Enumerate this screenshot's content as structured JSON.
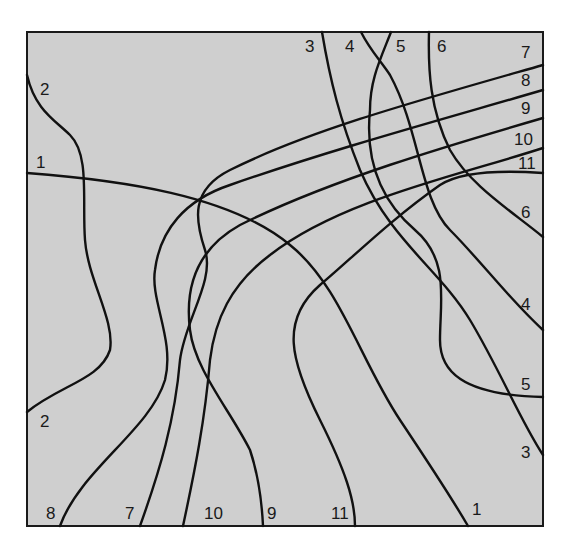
{
  "diagram": {
    "colors": {
      "background": "#ffffff",
      "square_fill": "#cfcfcf",
      "stroke": "#111111",
      "label": "#1a1a1a"
    },
    "frame": {
      "x": 27,
      "y": 32,
      "width": 516,
      "height": 494
    },
    "curves": [
      {
        "id": "1",
        "d": "M27,173 C120,180 230,195 290,245 C340,285 360,360 400,420 C430,465 450,495 468,526"
      },
      {
        "id": "2",
        "d": "M27,75 C35,110 55,120 70,135 C90,155 82,200 85,240 C88,280 115,320 110,350 C100,380 60,385 27,412"
      },
      {
        "id": "3",
        "d": "M322,32 C330,80 340,120 360,170 C390,240 440,270 470,320 C500,370 520,420 543,455"
      },
      {
        "id": "4",
        "d": "M361,32 C370,50 380,60 390,75 C420,130 420,200 450,230 C480,260 510,300 543,330"
      },
      {
        "id": "5",
        "d": "M391,32 C380,60 370,80 370,110 C365,160 380,200 415,230 C450,260 440,300 440,340 C440,370 460,395 543,397"
      },
      {
        "id": "6",
        "d": "M429,32 C428,70 430,110 450,150 C470,185 510,210 543,237"
      },
      {
        "id": "7",
        "d": "M543,65 C420,100 310,130 230,170 C190,190 195,220 205,250 C215,280 185,320 180,360 C175,420 160,470 140,526"
      },
      {
        "id": "8",
        "d": "M543,90 C440,120 330,150 230,185 C185,200 160,230 155,270 C150,300 175,340 165,380 C150,430 80,470 60,526"
      },
      {
        "id": "9",
        "d": "M543,118 C450,145 330,180 240,225 C195,250 185,290 190,330 C195,370 230,410 250,450 C260,480 262,505 263,526"
      },
      {
        "id": "10",
        "d": "M543,148 C460,175 340,200 270,255 C230,285 215,320 210,360 C205,420 195,470 183,526"
      },
      {
        "id": "11",
        "d": "M543,173 C500,170 460,172 440,185 C390,220 350,260 320,285 C280,320 290,360 320,420 C345,470 355,500 355,526"
      }
    ],
    "labels": [
      {
        "text": "2",
        "x": 40,
        "y": 95
      },
      {
        "text": "1",
        "x": 36,
        "y": 168
      },
      {
        "text": "3",
        "x": 305,
        "y": 52
      },
      {
        "text": "4",
        "x": 345,
        "y": 52
      },
      {
        "text": "5",
        "x": 396,
        "y": 52
      },
      {
        "text": "6",
        "x": 437,
        "y": 52
      },
      {
        "text": "7",
        "x": 521,
        "y": 58
      },
      {
        "text": "8",
        "x": 521,
        "y": 86
      },
      {
        "text": "9",
        "x": 521,
        "y": 114
      },
      {
        "text": "10",
        "x": 514,
        "y": 145
      },
      {
        "text": "11",
        "x": 518,
        "y": 169
      },
      {
        "text": "6",
        "x": 521,
        "y": 218
      },
      {
        "text": "4",
        "x": 521,
        "y": 310
      },
      {
        "text": "5",
        "x": 521,
        "y": 390
      },
      {
        "text": "3",
        "x": 521,
        "y": 458
      },
      {
        "text": "2",
        "x": 40,
        "y": 427
      },
      {
        "text": "8",
        "x": 46,
        "y": 519
      },
      {
        "text": "7",
        "x": 125,
        "y": 519
      },
      {
        "text": "10",
        "x": 204,
        "y": 519
      },
      {
        "text": "9",
        "x": 267,
        "y": 519
      },
      {
        "text": "11",
        "x": 331,
        "y": 519
      },
      {
        "text": "1",
        "x": 472,
        "y": 515
      }
    ]
  }
}
